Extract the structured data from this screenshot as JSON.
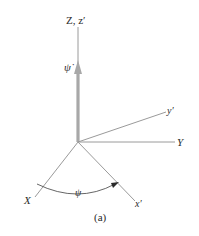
{
  "figure": {
    "caption": "(a)",
    "axes": {
      "z_label": "Z, z′",
      "y_label": "Y",
      "y_prime_label": "y′",
      "x_label": "X",
      "x_prime_label": "x′"
    },
    "rate_label": "ψ̇",
    "angle_label": "ψ",
    "colors": {
      "axis_line": "#9a9a9a",
      "rate_arrow": "#a8a8a8",
      "text": "#2a2a2a",
      "arc": "#555555"
    }
  }
}
